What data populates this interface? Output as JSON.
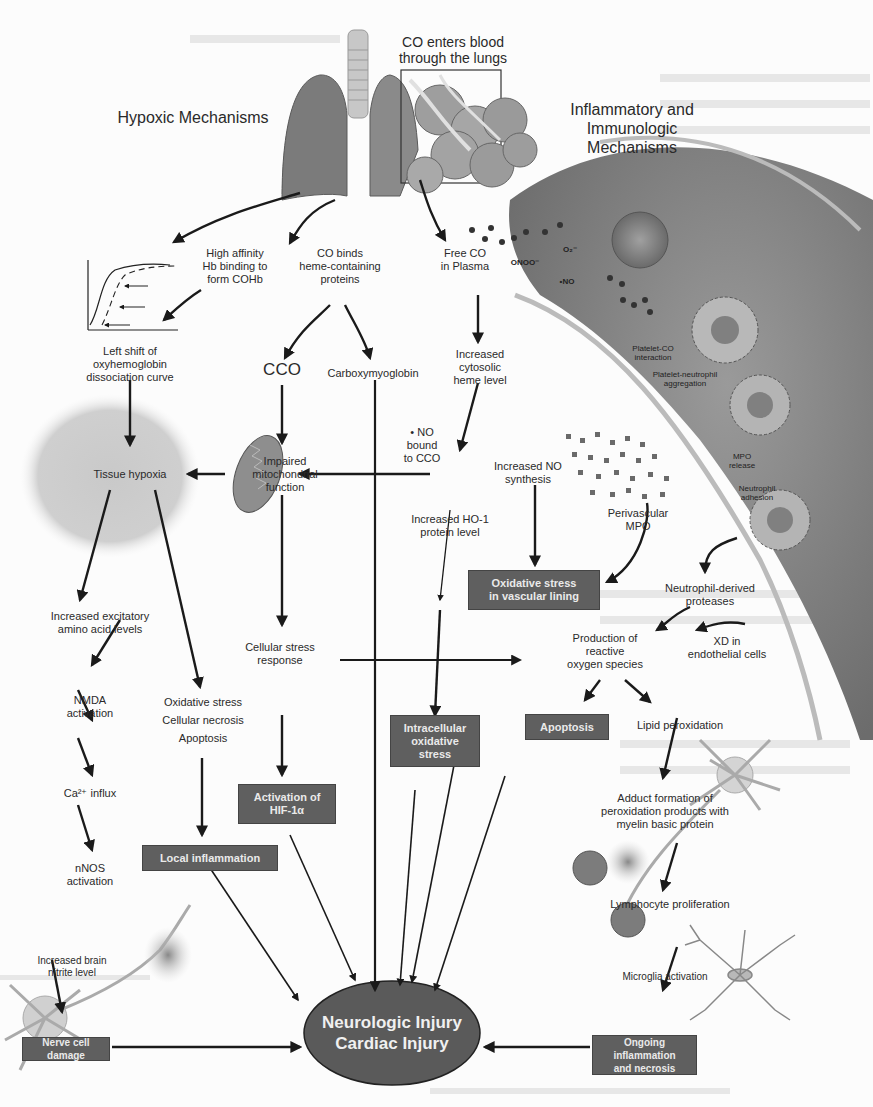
{
  "titles": {
    "entry": "CO enters blood\nthrough the lungs",
    "hypoxic": "Hypoxic Mechanisms",
    "inflammatory": "Inflammatory and\nImmunologic\nMechanisms"
  },
  "nodes": {
    "high_affinity": "High affinity\nHb binding to\nform COHb",
    "co_binds": "CO binds\nheme-containing\nproteins",
    "free_co": "Free CO\nin Plasma",
    "left_shift": "Left shift of\noxyhemoglobin\ndissociation curve",
    "cco": "CCO",
    "carboxymyoglobin": "Carboxymyoglobin",
    "cytosolic_heme": "Increased\ncytosolic\nheme level",
    "no_bound": "• NO\nbound\nto CCO",
    "tissue_hypoxia": "Tissue hypoxia",
    "impaired_mito": "Impaired\nmitochondrial\nfunction",
    "increased_no": "Increased NO\nsynthesis",
    "ho1": "Increased HO-1\nprotein level",
    "perivascular_mpo": "Perivascular\nMPO",
    "excitatory": "Increased excitatory\namino acid levels",
    "cellular_stress": "Cellular stress\nresponse",
    "neutrophil_proteases": "Neutrophil-derived\nproteases",
    "ros": "Production of\nreactive\noxygen species",
    "xd": "XD in\nendothelial cells",
    "nmda": "NMDA\nactivation",
    "ox_necrosis": "Oxidative stress\nCellular necrosis\nApoptosis",
    "lipid_perox": "Lipid peroxidation",
    "ca_influx": "Ca²⁺ influx",
    "adduct": "Adduct formation of\nperoxidation products with\nmyelin basic protein",
    "nnos": "nNOS\nactivation",
    "lymphocyte": "Lymphocyte proliferation",
    "brain_nitrite": "Increased brain\nnitrite level",
    "microglia": "Microglia activation"
  },
  "boxes": {
    "oxidative_vascular": "Oxidative stress\nin vascular lining",
    "apoptosis": "Apoptosis",
    "intracellular": "Intracellular\noxidative\nstress",
    "hif": "Activation of\nHIF-1α",
    "local_inflammation": "Local inflammation",
    "nerve_damage": "Nerve cell damage",
    "ongoing": "Ongoing inflammation\nand necrosis"
  },
  "outcome": "Neurologic Injury\nCardiac Injury",
  "vessel_labels": {
    "onoo": "ONOO⁻",
    "o2": "O₂⁻",
    "no": "•NO",
    "platelet_co": "Platelet-CO\ninteraction",
    "platelet_neutrophil": "Platelet-neutrophil\naggregation",
    "mpo_release": "MPO\nrelease",
    "neutrophil_adhesion": "Neutrophil\nadhesion"
  },
  "colors": {
    "box_fill": "#5f5f5f",
    "ellipse_fill": "#5a5a5a",
    "arrow": "#1a1a1a",
    "vessel": "#8a8a8a"
  }
}
